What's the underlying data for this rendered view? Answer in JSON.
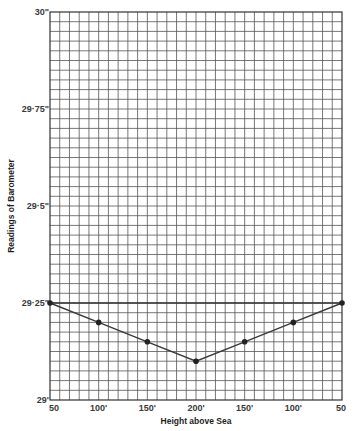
{
  "chart_data": {
    "type": "line",
    "title": "",
    "xlabel": "Height above Sea",
    "ylabel": "Readings of Barometer",
    "categories": [
      "50",
      "100'",
      "150'",
      "200'",
      "150'",
      "100'",
      "50"
    ],
    "x_positions": [
      0,
      1,
      2,
      3,
      4,
      5,
      6
    ],
    "series": [
      {
        "name": "Barometer reading",
        "values": [
          29.25,
          29.2,
          29.15,
          29.1,
          29.15,
          29.2,
          29.25
        ]
      }
    ],
    "ylim": [
      29.0,
      30.0
    ],
    "yticks": [
      {
        "value": 30.0,
        "label": "30\""
      },
      {
        "value": 29.75,
        "label": "29·75\""
      },
      {
        "value": 29.5,
        "label": "29·5\""
      },
      {
        "value": 29.25,
        "label": "29·25\""
      },
      {
        "value": 29.0,
        "label": "29'"
      }
    ],
    "grid": true,
    "grid_minor_per_x_interval": 5,
    "grid_minor_per_y_interval": 10,
    "reference_line": 29.25,
    "colors": {
      "line": "#3a3a3a",
      "grid": "#555555",
      "points": "#222222"
    }
  }
}
